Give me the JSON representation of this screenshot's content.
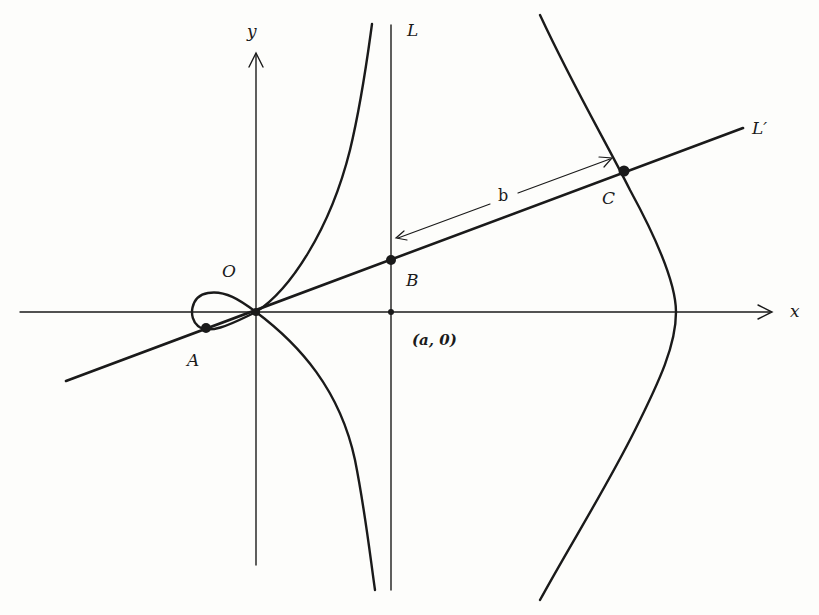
{
  "figure": {
    "type": "conchoid diagram",
    "colors": {
      "ink": "#1a1a1a",
      "paper": "#fdfdfb"
    }
  },
  "axes": {
    "x_label": "x",
    "y_label": "y"
  },
  "lines": {
    "L_label": "L",
    "L_prime_label": "L′"
  },
  "points": {
    "origin": "O",
    "A": "A",
    "B": "B",
    "C": "C",
    "a_point": "(a, 0)"
  },
  "measure": {
    "label": "b"
  }
}
